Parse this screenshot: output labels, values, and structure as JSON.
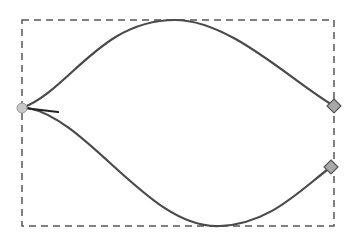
{
  "diagram": {
    "type": "bezier-path-node-editing",
    "colors": {
      "background": "#ffffff",
      "path_stroke": "#4a4a4a",
      "bbox_stroke": "#555555",
      "node_fill": "#a8a8a8",
      "node_stroke": "#555555",
      "cusp_node_fill": "#c8c8c8"
    },
    "bounding_box": {
      "x": 22,
      "y": 20,
      "width": 312,
      "height": 206,
      "style": "dashed"
    },
    "nodes": [
      {
        "id": "left-node",
        "shape": "circle",
        "x": 22,
        "y": 108
      },
      {
        "id": "top-right-node",
        "shape": "diamond",
        "x": 334,
        "y": 106
      },
      {
        "id": "bottom-right-node",
        "shape": "diamond",
        "x": 331,
        "y": 167
      }
    ],
    "segments": [
      {
        "id": "upper-curve",
        "d": "M22,108 C70,90 100,20 175,20 C230,20 290,80 334,106"
      },
      {
        "id": "lower-curve",
        "d": "M28,108 C90,120 150,230 220,226 C270,224 300,190 331,167"
      }
    ],
    "handle": {
      "x1": 24,
      "y1": 108,
      "x2": 58,
      "y2": 112
    }
  }
}
